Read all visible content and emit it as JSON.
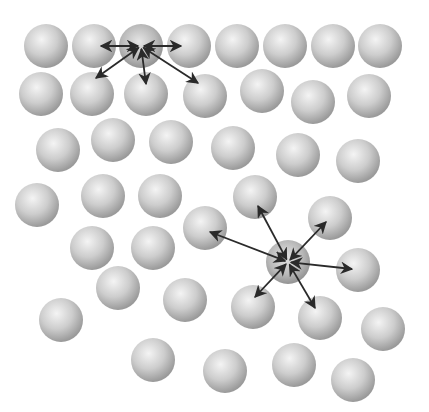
{
  "diagram": {
    "title": "",
    "sphere_radius": 22,
    "colors": {
      "background": "#ffffff",
      "sphere_light": "#f2f2f2",
      "sphere_mid": "#c8c8c8",
      "sphere_dark": "#8e8e8e",
      "arrow": "#2a2a2a"
    },
    "spheres": [
      [
        46,
        46
      ],
      [
        94,
        46
      ],
      [
        189,
        46
      ],
      [
        237,
        46
      ],
      [
        285,
        46
      ],
      [
        333,
        46
      ],
      [
        380,
        46
      ],
      [
        41,
        94
      ],
      [
        92,
        94
      ],
      [
        146,
        94
      ],
      [
        205,
        96
      ],
      [
        262,
        91
      ],
      [
        313,
        102
      ],
      [
        369,
        96
      ],
      [
        58,
        150
      ],
      [
        113,
        140
      ],
      [
        171,
        142
      ],
      [
        233,
        148
      ],
      [
        298,
        155
      ],
      [
        358,
        161
      ],
      [
        37,
        205
      ],
      [
        103,
        196
      ],
      [
        160,
        196
      ],
      [
        205,
        228
      ],
      [
        255,
        197
      ],
      [
        330,
        218
      ],
      [
        92,
        248
      ],
      [
        153,
        248
      ],
      [
        358,
        270
      ],
      [
        118,
        288
      ],
      [
        185,
        300
      ],
      [
        253,
        307
      ],
      [
        320,
        318
      ],
      [
        383,
        329
      ],
      [
        61,
        320
      ],
      [
        153,
        360
      ],
      [
        225,
        371
      ],
      [
        294,
        365
      ],
      [
        353,
        380
      ]
    ],
    "active": [
      {
        "name": "active-particle-top",
        "center": [
          141,
          46
        ],
        "arrows_to": [
          [
            101,
            46
          ],
          [
            181,
            46
          ],
          [
            96,
            78
          ],
          [
            146,
            84
          ],
          [
            198,
            83
          ]
        ]
      },
      {
        "name": "active-particle-bottom",
        "center": [
          288,
          262
        ],
        "arrows_to": [
          [
            210,
            232
          ],
          [
            258,
            206
          ],
          [
            326,
            222
          ],
          [
            352,
            269
          ],
          [
            255,
            297
          ],
          [
            315,
            308
          ]
        ]
      }
    ]
  }
}
